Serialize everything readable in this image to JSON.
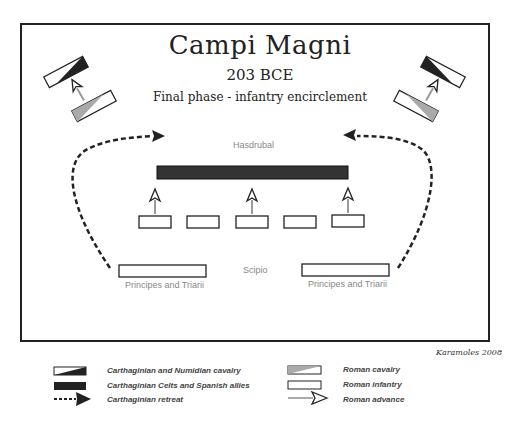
{
  "title": {
    "main": "Campi Magni",
    "year": "203 BCE",
    "subtitle": "Final phase - infantry encirclement"
  },
  "labels": {
    "hasdrubal": "Hasdrubal",
    "scipio": "Scipio",
    "principes_left": "Principes and Triarii",
    "principes_right": "Principes and Triarii"
  },
  "credit": "Karamoles 2008",
  "legend": [
    {
      "icon": "carthaginian-cavalry-icon",
      "label": "Carthaginian and Numidian cavalry"
    },
    {
      "icon": "carthaginian-infantry-icon",
      "label": "Carthaginian Celts and Spanish allies"
    },
    {
      "icon": "retreat-arrow-icon",
      "label": "Carthaginian retreat"
    },
    {
      "icon": "roman-cavalry-icon",
      "label": "Roman cavalry"
    },
    {
      "icon": "roman-infantry-icon",
      "label": "Roman infantry"
    },
    {
      "icon": "advance-arrow-icon",
      "label": "Roman advance"
    }
  ],
  "colors": {
    "frame": "#222222",
    "carthaginian": "#333333",
    "roman_cavalry": "#aaaaaa",
    "label_gray": "#888888"
  }
}
